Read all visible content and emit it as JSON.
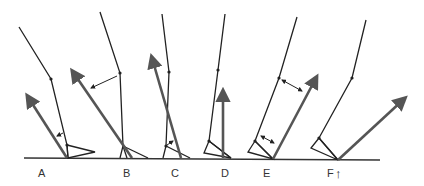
{
  "diagram": {
    "type": "gait-phase-force-vectors",
    "colors": {
      "background": "#ffffff",
      "limb": "#222222",
      "force_vector": "#555555",
      "ground": "#333333",
      "label": "#333333"
    },
    "phases": [
      {
        "id": "A",
        "label": "A"
      },
      {
        "id": "B",
        "label": "B"
      },
      {
        "id": "C",
        "label": "C"
      },
      {
        "id": "D",
        "label": "D"
      },
      {
        "id": "E",
        "label": "E"
      },
      {
        "id": "F",
        "label": "F"
      }
    ],
    "extra_marker": {
      "near": "F",
      "glyph": "↑"
    }
  }
}
